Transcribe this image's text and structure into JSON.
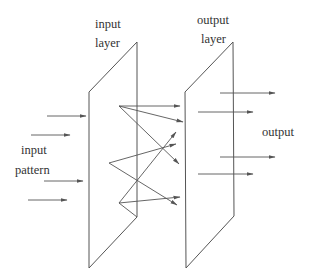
{
  "labels": {
    "input_layer_line1": "input",
    "input_layer_line2": "layer",
    "output_layer_line1": "output",
    "output_layer_line2": "layer",
    "input_pattern_line1": "input",
    "input_pattern_line2": "pattern",
    "output": "output"
  },
  "colors": {
    "line": "#555555",
    "text": "#333333",
    "background": "#ffffff"
  },
  "layers": [
    {
      "name": "input layer",
      "points": "89,92 137,42 137,217 89,268"
    },
    {
      "name": "output layer",
      "points": "185,92 233,42 234,216 186,268"
    }
  ],
  "input_arrows": [
    {
      "x1": 47,
      "y1": 116,
      "x2": 86,
      "y2": 116
    },
    {
      "x1": 31,
      "y1": 135,
      "x2": 70,
      "y2": 135
    },
    {
      "x1": 44,
      "y1": 181,
      "x2": 83,
      "y2": 181
    },
    {
      "x1": 28,
      "y1": 200,
      "x2": 67,
      "y2": 200
    }
  ],
  "connections": [
    {
      "from": "A",
      "x1": 119,
      "y1": 106,
      "x2": 180,
      "y2": 106
    },
    {
      "from": "A",
      "x1": 119,
      "y1": 106,
      "x2": 183,
      "y2": 122
    },
    {
      "from": "A",
      "x1": 119,
      "y1": 106,
      "x2": 179,
      "y2": 164
    },
    {
      "from": "B",
      "x1": 109,
      "y1": 163,
      "x2": 176,
      "y2": 144
    },
    {
      "from": "B",
      "x1": 109,
      "y1": 163,
      "x2": 177,
      "y2": 205
    },
    {
      "from": "C",
      "x1": 119,
      "y1": 203,
      "x2": 176,
      "y2": 132
    },
    {
      "from": "C",
      "x1": 119,
      "y1": 203,
      "x2": 180,
      "y2": 197
    },
    {
      "from": "C",
      "x1": 119,
      "y1": 203,
      "x2": 137,
      "y2": 217
    }
  ],
  "output_arrows": [
    {
      "x1": 220,
      "y1": 93,
      "x2": 275,
      "y2": 93
    },
    {
      "x1": 198,
      "y1": 112,
      "x2": 253,
      "y2": 112
    },
    {
      "x1": 220,
      "y1": 157,
      "x2": 275,
      "y2": 157
    },
    {
      "x1": 198,
      "y1": 174,
      "x2": 253,
      "y2": 174
    }
  ]
}
